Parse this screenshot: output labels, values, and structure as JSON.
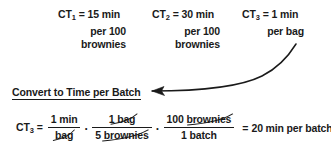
{
  "document": {
    "title": "Convert to Time per Batch",
    "ink_color": "#1a1a1a",
    "background_color": "#ffffff"
  },
  "definitions": [
    {
      "symbol": "CT",
      "subscript": "1",
      "equals": "=",
      "value": "15 min",
      "line2": "per 100",
      "line3": "brownies"
    },
    {
      "symbol": "CT",
      "subscript": "2",
      "equals": "=",
      "value": "30 min",
      "line2": "per 100",
      "line3": "brownies"
    },
    {
      "symbol": "CT",
      "subscript": "3",
      "equals": "=",
      "value": "1 min",
      "line2": "per bag",
      "line3": ""
    }
  ],
  "heading": {
    "text": "Convert to Time per Batch"
  },
  "equation": {
    "lhs_symbol": "CT",
    "lhs_subscript": "3",
    "lhs_equals": "=",
    "operator": "·",
    "factors": [
      {
        "numerator": "1 min",
        "denominator": "bag",
        "numerator_canceled": false,
        "denominator_canceled": true
      },
      {
        "numerator": "1 bag",
        "denominator": "5 brownies",
        "numerator_canceled": true,
        "denominator_canceled": true
      },
      {
        "numerator": "100 brownies",
        "denominator": "1 batch",
        "numerator_canceled": true,
        "denominator_canceled": false
      }
    ],
    "result_equals": "=",
    "result": "20 min per batch"
  },
  "annotation_arrow": {
    "name": "curved-arrow",
    "points_to": "Convert to Time per Batch",
    "originates_from": "CT3 definition"
  }
}
